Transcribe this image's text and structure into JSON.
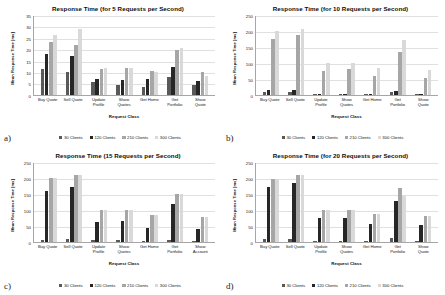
{
  "figure": {
    "panels": [
      {
        "tag": "a)",
        "chart_data": {
          "type": "bar",
          "title": "Response Time (for 5 Requests per Second)",
          "xlabel": "Request Class",
          "ylabel": "Mean Response Time [ms]",
          "ylim": [
            0,
            35
          ],
          "yticks": [
            0,
            5,
            10,
            15,
            20,
            25,
            30,
            35
          ],
          "grid": true,
          "legend_position": "bottom",
          "categories": [
            "Buy Quote",
            "Sell Quote",
            "Update Profile",
            "Show Quotes",
            "Get Home",
            "Get Portfolio",
            "Show Quote"
          ],
          "series": [
            {
              "name": "30 Clients",
              "color": "#595959",
              "values": [
                11.5,
                10.2,
                5.4,
                4.2,
                3.5,
                7.6,
                4.4
              ]
            },
            {
              "name": "120 Clients",
              "color": "#262626",
              "values": [
                17.8,
                16.8,
                6.8,
                6.3,
                6.8,
                12.1,
                6.2
              ]
            },
            {
              "name": "210 Clients",
              "color": "#a6a6a6",
              "values": [
                23.2,
                22.0,
                11.4,
                11.6,
                10.6,
                19.8,
                10.2
              ]
            },
            {
              "name": "300 Clients",
              "color": "#d9d9d9",
              "values": [
                26.2,
                28.8,
                11.8,
                11.6,
                10.0,
                20.4,
                8.2
              ]
            }
          ]
        }
      },
      {
        "tag": "b)",
        "chart_data": {
          "type": "bar",
          "title": "Response Time (for 10 Requests per Second)",
          "xlabel": "Request Class",
          "ylabel": "Mean Response Time [ms]",
          "ylim": [
            0,
            250
          ],
          "yticks": [
            0,
            50,
            100,
            150,
            200,
            250
          ],
          "grid": true,
          "legend_position": "bottom",
          "categories": [
            "Buy Quote",
            "Sell Quote",
            "Update Profile",
            "Show Quotes",
            "Get Home",
            "Get Portfolio",
            "Show Quote"
          ],
          "series": [
            {
              "name": "30 Clients",
              "color": "#595959",
              "values": [
                9,
                8,
                3,
                3,
                2,
                9,
                2
              ]
            },
            {
              "name": "120 Clients",
              "color": "#262626",
              "values": [
                14,
                16,
                4,
                4,
                3,
                13,
                3
              ]
            },
            {
              "name": "210 Clients",
              "color": "#a6a6a6",
              "values": [
                173,
                187,
                76,
                81,
                60,
                135,
                54
              ]
            },
            {
              "name": "300 Clients",
              "color": "#d9d9d9",
              "values": [
                198,
                206,
                101,
                99,
                85,
                171,
                79
              ]
            }
          ]
        }
      },
      {
        "tag": "c)",
        "chart_data": {
          "type": "bar",
          "title": "Response Time (15 Requests per Second)",
          "xlabel": "Request Class",
          "ylabel": "Mean Response Time [ms]",
          "ylim": [
            0,
            250
          ],
          "yticks": [
            0,
            50,
            100,
            150,
            200,
            250
          ],
          "grid": true,
          "legend_position": "bottom",
          "categories": [
            "Buy Quote",
            "Sell Quote",
            "Update Profile",
            "Show Quotes",
            "Get Home",
            "Get Portfolio",
            "Show Account"
          ],
          "series": [
            {
              "name": "30 Clients",
              "color": "#595959",
              "values": [
                7,
                9,
                5,
                5,
                4,
                7,
                2
              ]
            },
            {
              "name": "120 Clients",
              "color": "#262626",
              "values": [
                160,
                171,
                63,
                65,
                44,
                118,
                39
              ]
            },
            {
              "name": "210 Clients",
              "color": "#a6a6a6",
              "values": [
                200,
                209,
                100,
                100,
                84,
                150,
                79
              ]
            },
            {
              "name": "300 Clients",
              "color": "#d9d9d9",
              "values": [
                199,
                209,
                100,
                100,
                84,
                150,
                79
              ]
            }
          ]
        }
      },
      {
        "tag": "d)",
        "chart_data": {
          "type": "bar",
          "title": "Response Time (for 20 Requests per Second)",
          "xlabel": "Request Class",
          "ylabel": "Mean Response Time [ms]",
          "ylim": [
            0,
            250
          ],
          "yticks": [
            0,
            50,
            100,
            150,
            200,
            250
          ],
          "grid": true,
          "legend_position": "bottom",
          "categories": [
            "Buy Quote",
            "Sell Quote",
            "Update Profile",
            "Show Quotes",
            "Get Home",
            "Get Portfolio",
            "Show Quote"
          ],
          "series": [
            {
              "name": "30 Clients",
              "color": "#595959",
              "values": [
                9,
                10,
                4,
                3,
                3,
                11,
                3
              ]
            },
            {
              "name": "120 Clients",
              "color": "#262626",
              "values": [
                171,
                184,
                73,
                75,
                56,
                127,
                52
              ]
            },
            {
              "name": "210 Clients",
              "color": "#a6a6a6",
              "values": [
                196,
                210,
                101,
                101,
                86,
                167,
                80
              ]
            },
            {
              "name": "300 Clients",
              "color": "#d9d9d9",
              "values": [
                197,
                209,
                101,
                101,
                86,
                143,
                80
              ]
            }
          ]
        }
      }
    ]
  }
}
